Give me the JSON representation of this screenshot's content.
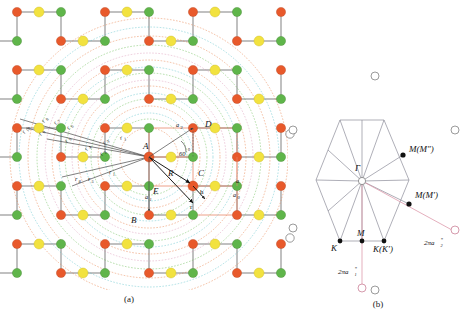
{
  "figure": {
    "panels": [
      {
        "id": "a",
        "caption": "(a)",
        "description": "Honeycomb lattice with concentric neighbour-shell circles"
      },
      {
        "id": "b",
        "caption": "(b)",
        "description": "First Brillouin zone hexagon with high symmetry points"
      }
    ]
  },
  "panel_a": {
    "caption": "(a)",
    "site_labels": [
      {
        "text": "A",
        "x": 143,
        "y": 149
      },
      {
        "text": "B",
        "x": 131,
        "y": 219
      },
      {
        "text": "C",
        "x": 196,
        "y": 175
      },
      {
        "text": "D",
        "x": 207,
        "y": 125
      },
      {
        "text": "E",
        "x": 153,
        "y": 191
      }
    ],
    "vector_labels": [
      {
        "text": "R",
        "x": 170,
        "y": 176
      },
      {
        "text": "h",
        "x": 200,
        "y": 194
      },
      {
        "text": "r",
        "x": 190,
        "y": 207
      }
    ],
    "lattice_vectors": [
      {
        "text": "a",
        "sub": "2",
        "x": 178,
        "y": 129
      },
      {
        "text": "a",
        "sub": "1",
        "x": 147,
        "y": 199
      }
    ],
    "angle_label": {
      "text": "60",
      "unit": "°",
      "x": 183,
      "y": 155
    },
    "constant_labels": [
      {
        "text": "a",
        "x": 237,
        "y": 182
      },
      {
        "text": "a",
        "sub": "0",
        "x": 234,
        "y": 196
      }
    ],
    "shell_radius_labels": [
      {
        "text": "r",
        "sub": "1",
        "x": 123,
        "y": 138
      },
      {
        "text": "r",
        "sub": "2",
        "x": 103,
        "y": 153
      },
      {
        "text": "r",
        "sub": "3",
        "x": 106,
        "y": 142
      },
      {
        "text": "r",
        "sub": "4",
        "x": 88,
        "y": 148
      },
      {
        "text": "r",
        "sub": "5",
        "x": 68,
        "y": 140
      },
      {
        "text": "r",
        "sub": "6",
        "x": 70,
        "y": 127
      },
      {
        "text": "r",
        "sub": "7",
        "x": 57,
        "y": 122
      },
      {
        "text": "r",
        "sub": "8",
        "x": 45,
        "y": 120
      },
      {
        "text": "r",
        "sub": "9",
        "x": 42,
        "y": 133
      },
      {
        "text": "r",
        "sub": "10",
        "x": 26,
        "y": 130
      },
      {
        "text": "r",
        "sub": "1",
        "x": 112,
        "y": 173
      },
      {
        "text": "r",
        "sub": "8",
        "x": 78,
        "y": 180
      },
      {
        "text": "r",
        "sub": "5",
        "x": 91,
        "y": 180
      }
    ],
    "atom_colors": {
      "sublattice_a": "#e8592b",
      "sublattice_b": "#5fb54a",
      "center_site": "#f2e23f",
      "hollow_site": "#ffffff"
    },
    "ring_colors": [
      "#e8793f",
      "#63b94e",
      "#58c0c8",
      "#d98fb0"
    ],
    "bond_color": "#6b6b6b",
    "highlight_bond_color": "#e8886a",
    "hollow_markers": [
      {
        "x": 290,
        "y": 134
      },
      {
        "x": 290,
        "y": 238
      }
    ]
  },
  "panel_b": {
    "caption": "(b)",
    "center_label": {
      "text": "Γ",
      "x": 375,
      "y": 162
    },
    "symmetry_points": [
      {
        "text": "K",
        "x": 333,
        "y": 248,
        "px": 340,
        "py": 241
      },
      {
        "text": "M",
        "x": 358,
        "y": 236,
        "px": 362,
        "py": 241
      },
      {
        "text": "K(K′)",
        "x": 375,
        "y": 250,
        "px": 384,
        "py": 241
      },
      {
        "text": "M(M″)",
        "x": 410,
        "y": 152,
        "px": 403,
        "py": 155
      },
      {
        "text": "M(M′)",
        "x": 418,
        "y": 198,
        "px": 409,
        "py": 204
      }
    ],
    "reciprocal_vectors": [
      {
        "text": "2πa",
        "sup": "*",
        "sub": "2",
        "x": 424,
        "y": 240
      },
      {
        "text": "2πa",
        "sup": "*",
        "sub": "1",
        "x": 362,
        "y": 271
      }
    ],
    "reciprocal_lattice_points": [
      {
        "x": 375,
        "y": 76
      },
      {
        "x": 293,
        "y": 130
      },
      {
        "x": 455,
        "y": 130
      },
      {
        "x": 293,
        "y": 228
      },
      {
        "x": 455,
        "y": 228
      },
      {
        "x": 375,
        "y": 290
      }
    ],
    "bz_outline_color": "#8d8d9a",
    "vector_color": "#d98da0"
  }
}
